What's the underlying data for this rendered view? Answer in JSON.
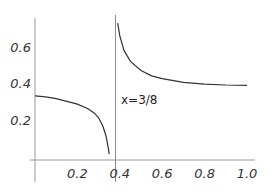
{
  "chart_data": {
    "type": "line",
    "title": "",
    "xlabel": "",
    "ylabel": "",
    "xlim": [
      0,
      1.0
    ],
    "ylim": [
      0,
      0.75
    ],
    "grid": false,
    "legend": null,
    "x_ticks": [
      "0.2",
      "0.4",
      "0.6",
      "0.8",
      "1.0"
    ],
    "y_ticks": [
      "0.2",
      "0.4",
      "0.6"
    ],
    "asymptote": {
      "x": 0.375,
      "label": "x=3/8"
    },
    "series": [
      {
        "name": "left branch",
        "x": [
          0.0,
          0.05,
          0.1,
          0.15,
          0.2,
          0.25,
          0.28,
          0.3,
          0.32,
          0.335,
          0.345,
          0.35
        ],
        "y": [
          0.33,
          0.325,
          0.315,
          0.3,
          0.285,
          0.26,
          0.235,
          0.21,
          0.165,
          0.11,
          0.05,
          0.01
        ]
      },
      {
        "name": "right branch",
        "x": [
          0.39,
          0.4,
          0.42,
          0.45,
          0.5,
          0.55,
          0.6,
          0.7,
          0.8,
          0.9,
          1.0
        ],
        "y": [
          0.73,
          0.66,
          0.58,
          0.52,
          0.47,
          0.44,
          0.425,
          0.405,
          0.395,
          0.39,
          0.388
        ]
      }
    ]
  }
}
